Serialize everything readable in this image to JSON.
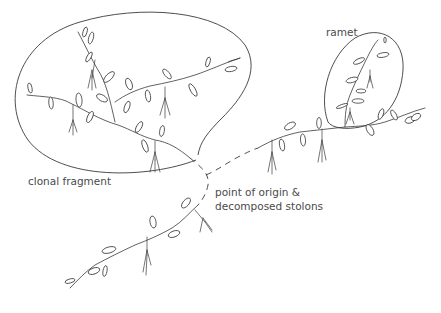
{
  "figure": {
    "labels": {
      "ramet": "ramet",
      "clonal_fragment": "clonal fragment",
      "origin_line1": "point of origin &",
      "origin_line2": "decomposed stolons"
    },
    "parts": [
      {
        "id": "clonal-fragment",
        "kind": "enclosed-region",
        "description": "group of connected ramets still linked by stolons"
      },
      {
        "id": "ramet",
        "kind": "enclosed-region",
        "description": "single rooted shoot unit"
      },
      {
        "id": "point-of-origin",
        "kind": "dashed-stolon",
        "description": "decomposed stolon segments at the point of origin"
      }
    ],
    "colors": {
      "line": "#3a3a3a",
      "text": "#4a4a4a",
      "background": "#ffffff"
    }
  }
}
